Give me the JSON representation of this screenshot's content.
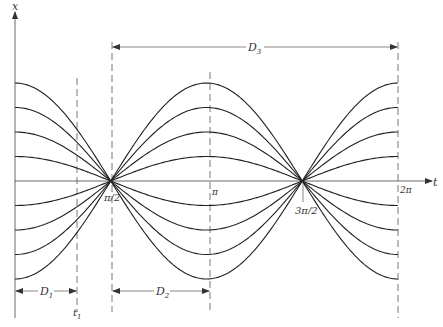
{
  "figure": {
    "axes": {
      "x_label": "t",
      "y_label": "x"
    },
    "ticks": [
      {
        "label": "π/2",
        "t": 1.5708
      },
      {
        "label": "π",
        "t": 3.1416
      },
      {
        "label": "3π/2",
        "t": 4.7124
      },
      {
        "label": "2π",
        "t": 6.2832
      }
    ],
    "dimensions": {
      "D1": "D",
      "D1_sub": "1",
      "D2": "D",
      "D2_sub": "2",
      "D3": "D",
      "D3_sub": "3",
      "t1": "t",
      "t1_sub": "1"
    },
    "curves": {
      "description": "Family of curves x = A·cos(t) for amplitudes ±1..±4, all crossing zero at π/2 and 3π/2",
      "amplitudes": [
        1,
        2,
        3,
        4,
        -1,
        -2,
        -3,
        -4
      ],
      "domain": [
        0,
        6.2832
      ]
    }
  }
}
